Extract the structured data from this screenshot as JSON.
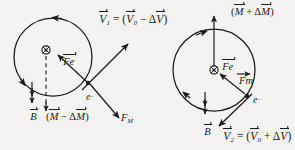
{
  "figure": {
    "background_color": "#f4f3f1",
    "ink_color": "#1b1b1b",
    "panels": [
      {
        "id": "left",
        "description": "electron orbit with decelerating velocity",
        "circle": {
          "cx": 53,
          "cy": 57,
          "r": 39
        },
        "center_symbol": "circle-cross",
        "orbit_direction": "counter-clockwise",
        "labels": {
          "velocity": "V₁ = (V₀ − ΔV)",
          "electric_force": "Fe",
          "magnetic_force": "F_M",
          "electron": "e⁻",
          "field": "B",
          "moment": "(M − ΔM)"
        }
      },
      {
        "id": "right",
        "description": "electron orbit with accelerating velocity",
        "circle": {
          "cx": 214,
          "cy": 70,
          "r": 41
        },
        "center_symbol": "circle-cross",
        "orbit_direction": "clockwise",
        "labels": {
          "velocity": "V₂ = (V₀ + ΔV)",
          "electric_force": "Fe",
          "magnetic_force": "Fm",
          "electron": "e⁻",
          "field": "B",
          "moment": "(M + ΔM)"
        }
      }
    ],
    "text": {
      "v1_lead": "V",
      "v1_sub": "1",
      "v1_eq": " = (",
      "v0": "V",
      "v0_sub": "0",
      "v1_minus": " − Δ",
      "dv": "V",
      "close": ")",
      "v2_sub": "2",
      "v2_plus": " + Δ",
      "fe": "Fe",
      "fm_cap": "F",
      "fm_cap_sub": "M",
      "fm_low": "Fm",
      "electron": "e",
      "electron_sup": "−",
      "b": "B",
      "m": "M",
      "m_minus": " − Δ",
      "m_plus": " + Δ",
      "open": "("
    }
  }
}
